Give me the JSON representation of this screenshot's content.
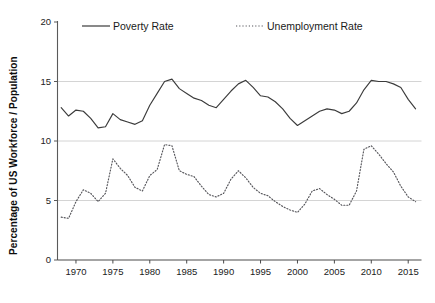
{
  "chart_data": {
    "type": "line",
    "title": "",
    "xlabel": "",
    "ylabel": "Percentage of US Workforce / Population",
    "xlim": [
      1967.5,
      2016.8
    ],
    "ylim": [
      0,
      20
    ],
    "yticks": [
      0,
      5,
      10,
      15,
      20
    ],
    "ytick_labels": [
      "0",
      "5",
      "10",
      "15",
      "20"
    ],
    "xticks": [
      1970,
      1975,
      1980,
      1985,
      1990,
      1995,
      2000,
      2005,
      2010,
      2015
    ],
    "xtick_labels": [
      "1970",
      "1975",
      "1980",
      "1985",
      "1990",
      "1995",
      "2000",
      "2005",
      "2010",
      "2015"
    ],
    "grid": "horizontal",
    "gridlines": [
      5,
      10,
      15
    ],
    "legend_position": "top",
    "x": [
      1968,
      1969,
      1970,
      1971,
      1972,
      1973,
      1974,
      1975,
      1976,
      1977,
      1978,
      1979,
      1980,
      1981,
      1982,
      1983,
      1984,
      1985,
      1986,
      1987,
      1988,
      1989,
      1990,
      1991,
      1992,
      1993,
      1994,
      1995,
      1996,
      1997,
      1998,
      1999,
      2000,
      2001,
      2002,
      2003,
      2004,
      2005,
      2006,
      2007,
      2008,
      2009,
      2010,
      2011,
      2012,
      2013,
      2014,
      2015,
      2016
    ],
    "series": [
      {
        "name": "Poverty Rate",
        "style": "solid",
        "color": "#3b3b3b",
        "values": [
          12.8,
          12.1,
          12.6,
          12.5,
          11.9,
          11.1,
          11.2,
          12.3,
          11.8,
          11.6,
          11.4,
          11.7,
          13.0,
          14.0,
          15.0,
          15.2,
          14.4,
          14.0,
          13.6,
          13.4,
          13.0,
          12.8,
          13.5,
          14.2,
          14.8,
          15.1,
          14.5,
          13.8,
          13.7,
          13.3,
          12.7,
          11.9,
          11.3,
          11.7,
          12.1,
          12.5,
          12.7,
          12.6,
          12.3,
          12.5,
          13.2,
          14.3,
          15.1,
          15.0,
          15.0,
          14.8,
          14.5,
          13.5,
          12.7
        ]
      },
      {
        "name": "Unemployment Rate",
        "style": "dotted",
        "color": "#55555a",
        "values": [
          3.6,
          3.5,
          4.9,
          5.9,
          5.6,
          4.9,
          5.6,
          8.5,
          7.7,
          7.1,
          6.1,
          5.8,
          7.1,
          7.6,
          9.7,
          9.6,
          7.5,
          7.2,
          7.0,
          6.2,
          5.5,
          5.3,
          5.6,
          6.8,
          7.5,
          6.9,
          6.1,
          5.6,
          5.4,
          4.9,
          4.5,
          4.2,
          4.0,
          4.7,
          5.8,
          6.0,
          5.5,
          5.1,
          4.6,
          4.6,
          5.8,
          9.3,
          9.6,
          8.9,
          8.1,
          7.4,
          6.2,
          5.3,
          4.9
        ]
      }
    ]
  },
  "legend": {
    "items": [
      {
        "label": "Poverty Rate",
        "style": "solid"
      },
      {
        "label": "Unemployment Rate",
        "style": "dotted"
      }
    ]
  },
  "axis": {
    "y_title": "Percentage of US Workforce / Population"
  }
}
